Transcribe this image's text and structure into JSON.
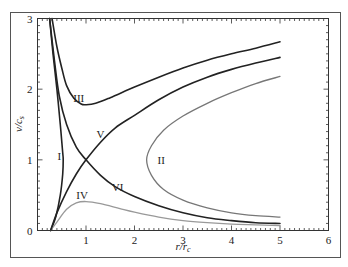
{
  "chart_data": {
    "type": "line",
    "title": "",
    "xlabel": "r/r_c",
    "ylabel": "v/c_s",
    "xlim": [
      0,
      6
    ],
    "ylim": [
      0,
      3
    ],
    "xticks": [
      0,
      1,
      2,
      3,
      4,
      5,
      6
    ],
    "yticks": [
      0,
      1,
      2,
      3
    ],
    "xtick_labels": [
      "",
      "1",
      "2",
      "3",
      "4",
      "5",
      "6"
    ],
    "ytick_labels": [
      "0",
      "1",
      "2",
      "3"
    ],
    "grid": false,
    "legend": null,
    "series": [
      {
        "name": "I",
        "color": "#222222",
        "width": 1.6,
        "label_pos": [
          0.45,
          1.05
        ],
        "points": [
          [
            0.25,
            3.0
          ],
          [
            0.32,
            2.5
          ],
          [
            0.4,
            2.0
          ],
          [
            0.47,
            1.5
          ],
          [
            0.52,
            1.1
          ],
          [
            0.53,
            1.0
          ],
          [
            0.52,
            0.8
          ],
          [
            0.47,
            0.5
          ],
          [
            0.38,
            0.2
          ],
          [
            0.3,
            0.05
          ],
          [
            0.27,
            0.0
          ]
        ]
      },
      {
        "name": "II",
        "color": "#777777",
        "width": 1.3,
        "label_pos": [
          2.55,
          1.0
        ],
        "points": [
          [
            5.0,
            2.18
          ],
          [
            4.5,
            2.08
          ],
          [
            4.0,
            1.95
          ],
          [
            3.5,
            1.8
          ],
          [
            3.0,
            1.62
          ],
          [
            2.6,
            1.42
          ],
          [
            2.35,
            1.2
          ],
          [
            2.25,
            1.0
          ],
          [
            2.35,
            0.78
          ],
          [
            2.6,
            0.58
          ],
          [
            3.0,
            0.43
          ],
          [
            3.5,
            0.32
          ],
          [
            4.0,
            0.25
          ],
          [
            4.5,
            0.21
          ],
          [
            5.0,
            0.19
          ]
        ]
      },
      {
        "name": "III",
        "color": "#222222",
        "width": 1.6,
        "label_pos": [
          0.85,
          1.88
        ],
        "points": [
          [
            0.3,
            3.0
          ],
          [
            0.4,
            2.6
          ],
          [
            0.5,
            2.3
          ],
          [
            0.6,
            2.05
          ],
          [
            0.75,
            1.87
          ],
          [
            0.9,
            1.79
          ],
          [
            1.0,
            1.78
          ],
          [
            1.2,
            1.8
          ],
          [
            1.5,
            1.88
          ],
          [
            2.0,
            2.03
          ],
          [
            2.5,
            2.17
          ],
          [
            3.0,
            2.3
          ],
          [
            3.5,
            2.41
          ],
          [
            4.0,
            2.5
          ],
          [
            4.5,
            2.58
          ],
          [
            5.0,
            2.67
          ]
        ]
      },
      {
        "name": "IV",
        "color": "#999999",
        "width": 1.3,
        "label_pos": [
          0.92,
          0.5
        ],
        "points": [
          [
            0.27,
            0.0
          ],
          [
            0.4,
            0.12
          ],
          [
            0.6,
            0.3
          ],
          [
            0.8,
            0.39
          ],
          [
            1.0,
            0.41
          ],
          [
            1.3,
            0.38
          ],
          [
            1.7,
            0.31
          ],
          [
            2.0,
            0.26
          ],
          [
            2.5,
            0.19
          ],
          [
            3.0,
            0.14
          ],
          [
            3.5,
            0.11
          ],
          [
            4.0,
            0.09
          ],
          [
            4.5,
            0.08
          ],
          [
            5.0,
            0.07
          ]
        ]
      },
      {
        "name": "V",
        "color": "#222222",
        "width": 1.6,
        "label_pos": [
          1.3,
          1.36
        ],
        "points": [
          [
            0.27,
            0.0
          ],
          [
            0.4,
            0.25
          ],
          [
            0.6,
            0.55
          ],
          [
            0.8,
            0.8
          ],
          [
            1.0,
            1.0
          ],
          [
            1.3,
            1.25
          ],
          [
            1.6,
            1.45
          ],
          [
            2.0,
            1.63
          ],
          [
            2.5,
            1.85
          ],
          [
            3.0,
            2.03
          ],
          [
            3.5,
            2.17
          ],
          [
            4.0,
            2.28
          ],
          [
            4.5,
            2.37
          ],
          [
            5.0,
            2.45
          ]
        ]
      },
      {
        "name": "VI",
        "color": "#222222",
        "width": 1.6,
        "label_pos": [
          1.65,
          0.62
        ],
        "points": [
          [
            0.25,
            3.0
          ],
          [
            0.35,
            2.4
          ],
          [
            0.45,
            1.9
          ],
          [
            0.6,
            1.5
          ],
          [
            0.8,
            1.18
          ],
          [
            1.0,
            1.0
          ],
          [
            1.3,
            0.78
          ],
          [
            1.6,
            0.62
          ],
          [
            2.0,
            0.48
          ],
          [
            2.5,
            0.35
          ],
          [
            3.0,
            0.25
          ],
          [
            3.5,
            0.18
          ],
          [
            4.0,
            0.14
          ],
          [
            4.5,
            0.11
          ],
          [
            5.0,
            0.1
          ]
        ]
      }
    ]
  }
}
